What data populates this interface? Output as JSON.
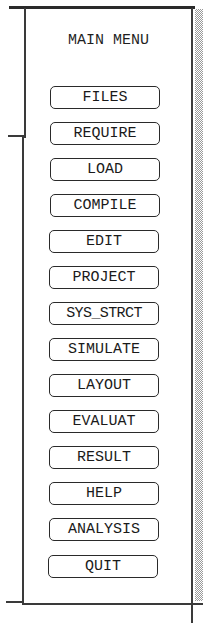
{
  "window": {
    "title": "MAIN MENU"
  },
  "menu": {
    "items": [
      {
        "label": "FILES"
      },
      {
        "label": "REQUIRE"
      },
      {
        "label": "LOAD"
      },
      {
        "label": "COMPILE"
      },
      {
        "label": "EDIT"
      },
      {
        "label": "PROJECT"
      },
      {
        "label": "SYS_STRCT"
      },
      {
        "label": "SIMULATE"
      },
      {
        "label": "LAYOUT"
      },
      {
        "label": "EVALUAT"
      },
      {
        "label": "RESULT"
      },
      {
        "label": "HELP"
      },
      {
        "label": "ANALYSIS"
      },
      {
        "label": "QUIT"
      }
    ]
  },
  "colors": {
    "border": "#3a3a3a",
    "text": "#1a1a1a",
    "background": "#ffffff",
    "shadow": "#9a9a9a"
  }
}
